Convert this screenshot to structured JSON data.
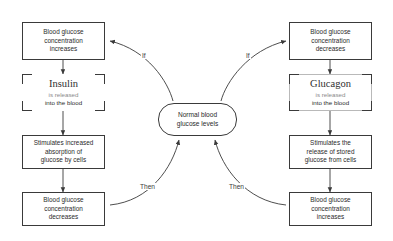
{
  "diagram": {
    "center": {
      "label_line1": "Normal blood",
      "label_line2": "glucose levels"
    },
    "left_pathway": {
      "trigger": {
        "line1": "Blood glucose",
        "line2": "concentration",
        "line3": "increases"
      },
      "hormone": {
        "name": "Insulin",
        "sub_line1": "is released",
        "sub_line2": "into the blood"
      },
      "action": {
        "line1": "Stimulates increased",
        "line2": "absorption of",
        "line3": "glucose by cells"
      },
      "result": {
        "line1": "Blood glucose",
        "line2": "concentration",
        "line3": "decreases"
      },
      "if_label": "If",
      "then_label": "Then"
    },
    "right_pathway": {
      "trigger": {
        "line1": "Blood glucose",
        "line2": "concentration",
        "line3": "decreases"
      },
      "hormone": {
        "name": "Glucagon",
        "sub_line1": "is released",
        "sub_line2": "into the blood"
      },
      "action": {
        "line1": "Stimulates the",
        "line2": "release of stored",
        "line3": "glucose from cells"
      },
      "result": {
        "line1": "Blood glucose",
        "line2": "concentration",
        "line3": "increases"
      },
      "if_label": "If",
      "then_label": "Then"
    },
    "colors": {
      "stroke": "#3a3a3a",
      "text": "#2b2b2b",
      "background": "#ffffff",
      "faint_stroke": "#b9b9b9"
    }
  }
}
